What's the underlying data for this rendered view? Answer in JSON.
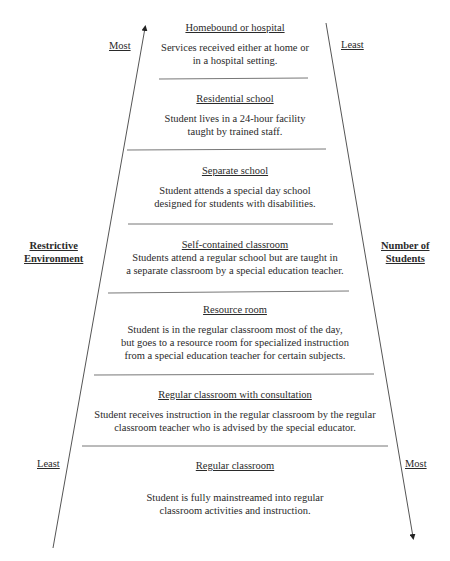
{
  "left_axis": {
    "label_line1": "Restrictive",
    "label_line2": "Environment",
    "top": "Most",
    "bottom": "Least"
  },
  "right_axis": {
    "label_line1": "Number of",
    "label_line2": "Students",
    "top": "Least",
    "bottom": "Most"
  },
  "levels": [
    {
      "title": "Homebound or hospital",
      "desc1": "Services received either at home or",
      "desc2": "in a hospital setting.",
      "desc3": ""
    },
    {
      "title": "Residential school",
      "desc1": "Student lives in a 24-hour facility",
      "desc2": "taught by trained staff.",
      "desc3": ""
    },
    {
      "title": "Separate school",
      "desc1": "Student attends a special day school",
      "desc2": "designed for students with disabilities.",
      "desc3": ""
    },
    {
      "title": "Self-contained classroom",
      "desc1": "Students attend a regular school but are taught in",
      "desc2": "a separate classroom by a special education teacher.",
      "desc3": ""
    },
    {
      "title": "Resource room",
      "desc1": "Student is in the regular classroom most of the day,",
      "desc2": "but goes to a resource room for specialized instruction",
      "desc3": "from a special education teacher for certain subjects."
    },
    {
      "title": "Regular classroom with consultation",
      "desc1": "Student receives instruction in the regular classroom by the regular",
      "desc2": "classroom teacher who is advised by the special educator.",
      "desc3": ""
    },
    {
      "title": "Regular classroom",
      "desc1": "Student is fully mainstreamed into regular",
      "desc2": "classroom activities and instruction.",
      "desc3": ""
    }
  ],
  "colors": {
    "line": "#555555",
    "text": "#2a2a2a"
  }
}
